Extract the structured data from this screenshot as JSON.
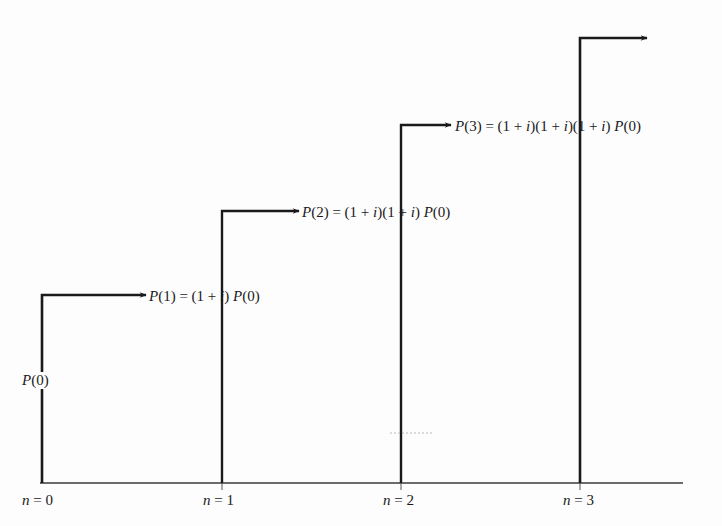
{
  "diagram": {
    "title": "",
    "colors": {
      "ink": "#1a1a1a",
      "background": "#fdfdfd"
    },
    "axis": {
      "ticks": [
        {
          "var": "n",
          "eq": " = ",
          "value": "0"
        },
        {
          "var": "n",
          "eq": " = ",
          "value": "1"
        },
        {
          "var": "n",
          "eq": " = ",
          "value": "2"
        },
        {
          "var": "n",
          "eq": " = ",
          "value": "3"
        }
      ]
    },
    "labels": {
      "p0": {
        "P": "P",
        "rest": "(0)"
      },
      "p1": {
        "P": "P",
        "lhs": "(1) = (1 + ",
        "i": "i",
        "mid": ") ",
        "P2": "P",
        "rhs": "(0)"
      },
      "p2": {
        "P": "P",
        "lhs": "(2) = (1 + ",
        "i1": "i",
        "mid1": ")(1 + ",
        "i2": "i",
        "mid2": ") ",
        "P2": "P",
        "rhs": "(0)"
      },
      "p3": {
        "P": "P",
        "lhs": "(3) = (1 + ",
        "i1": "i",
        "mid1": ")(1 + ",
        "i2": "i",
        "mid2": ")(1 + ",
        "i3": "i",
        "mid3": ") ",
        "P2": "P",
        "rhs": "(0)"
      }
    },
    "steps": [
      {
        "n": 0,
        "amount": "P(0)",
        "formula": "P(1) = (1 + i) P(0)"
      },
      {
        "n": 1,
        "formula": "P(2) = (1 + i)(1 + i) P(0)"
      },
      {
        "n": 2,
        "formula": "P(3) = (1 + i)(1 + i)(1 + i) P(0)"
      },
      {
        "n": 3,
        "formula": ""
      }
    ]
  }
}
